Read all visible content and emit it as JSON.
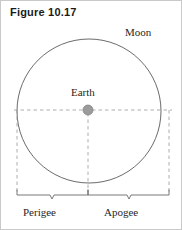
{
  "figure": {
    "title": "Figure 10.17",
    "caption_labels": {
      "moon": "Moon",
      "earth": "Earth",
      "perigee": "Perigee",
      "apogee": "Apogee"
    },
    "colors": {
      "orbit_stroke": "#5a5a5a",
      "dashed_guide": "#9a9a9a",
      "earth_body": "#9b9b9b",
      "earth_body_edge": "#7d7d7d",
      "brace_stroke": "#6a6a6a",
      "text": "#1f1f1f",
      "title_text": "#1a1a1a",
      "page_border": "#c9c9c9",
      "background": "#ffffff"
    },
    "geometry": {
      "orbit_center_x": 88,
      "orbit_center_y": 110,
      "orbit_radius": 72,
      "earth_marker_x": 87,
      "earth_marker_y": 109,
      "earth_marker_radius": 5,
      "guide_line_y": 109,
      "guide_line_x_start": 13,
      "guide_line_x_end": 171,
      "left_drop_x": 16,
      "center_drop_x": 87,
      "right_drop_x": 168,
      "drop_line_bottom_y": 191,
      "brace_y": 194,
      "brace_tick_height": 5,
      "brace_notch_depth": 4,
      "perigee_span": [
        16,
        87
      ],
      "apogee_span": [
        87,
        168
      ]
    }
  }
}
